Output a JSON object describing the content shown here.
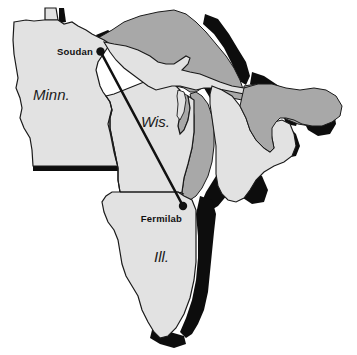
{
  "figure": {
    "type": "map",
    "region": "Upper Midwest United States / Great Lakes"
  },
  "colors": {
    "land_fill": "#e2e2e2",
    "water_fill": "#a8a8a8",
    "shadow_fill": "#0d0d0d",
    "outline_stroke": "#1a1a1a",
    "beam_stroke": "#111111",
    "marker_fill": "#111111",
    "background": "#ffffff",
    "label_text": "#1a1a1a"
  },
  "state_labels": [
    {
      "name": "minnesota",
      "text": "Minn.",
      "x": 33,
      "y": 100
    },
    {
      "name": "wisconsin",
      "text": "Wis.",
      "x": 141,
      "y": 127
    },
    {
      "name": "illinois",
      "text": "Ill.",
      "x": 154,
      "y": 262
    }
  ],
  "sites": [
    {
      "name": "soudan",
      "label": "Soudan",
      "label_x": 88,
      "label_y": 54,
      "label_anchor": "end",
      "dot_x": 100.5,
      "dot_y": 51.5,
      "dot_r": 4.2
    },
    {
      "name": "fermilab",
      "label": "Fermilab",
      "label_x": 177,
      "label_y": 222,
      "label_anchor": "end",
      "dot_x": 183,
      "dot_y": 206,
      "dot_r": 4.2
    }
  ],
  "beam": {
    "name": "neutrino-beam-line",
    "from": "soudan",
    "to": "fermilab",
    "x1": 100.5,
    "y1": 51.5,
    "x2": 183,
    "y2": 206,
    "stroke_width": 2.6
  }
}
